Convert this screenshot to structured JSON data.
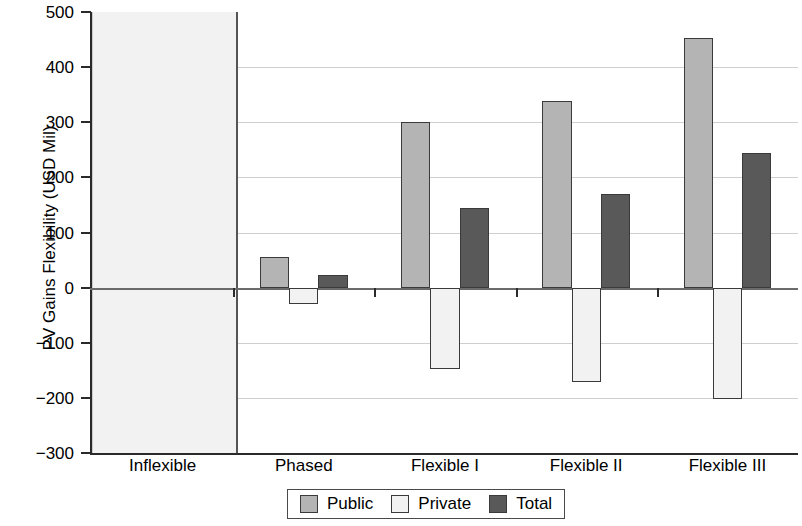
{
  "chart_data": {
    "type": "bar",
    "title": "",
    "subtitle": "",
    "xlabel": "",
    "ylabel": "PV Gains Flexibility (USD Mil)",
    "categories": [
      "Inflexible",
      "Phased",
      "Flexible I",
      "Flexible II",
      "Flexible III"
    ],
    "series": [
      {
        "name": "Public",
        "color": "#b4b4b4",
        "values": [
          null,
          55,
          301,
          338,
          452
        ]
      },
      {
        "name": "Private",
        "color": "#f2f2f2",
        "values": [
          null,
          -30,
          -148,
          -172,
          -202
        ]
      },
      {
        "name": "Total",
        "color": "#595959",
        "values": [
          null,
          22,
          145,
          169,
          245
        ]
      }
    ],
    "ylim": [
      -300,
      500
    ],
    "yticks": [
      500,
      400,
      300,
      200,
      100,
      0,
      -100,
      -200,
      -300
    ],
    "ytick_labels": [
      "500",
      "400",
      "300",
      "200",
      "100",
      "0",
      "−100",
      "−200",
      "−300"
    ],
    "grid": true,
    "legend_position": "bottom-center",
    "highlight_band": {
      "category": "Inflexible",
      "note": "shaded region with no bars",
      "color": "#f2f2f2"
    }
  },
  "legend": {
    "items": [
      {
        "label": "Public",
        "color": "#b4b4b4"
      },
      {
        "label": "Private",
        "color": "#f2f2f2"
      },
      {
        "label": "Total",
        "color": "#595959"
      }
    ]
  }
}
